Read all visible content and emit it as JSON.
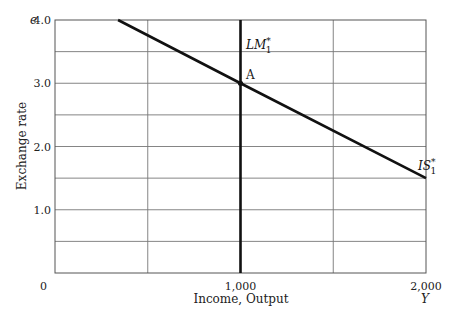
{
  "chart_data": {
    "type": "line",
    "title": "",
    "xlabel": "Income, Output",
    "xvar": "Y",
    "ylabel": "Exchange rate",
    "yvar": "e",
    "xlim": [
      0,
      2000
    ],
    "ylim": [
      0,
      4.0
    ],
    "grid": true,
    "x_ticks": [
      {
        "value": 0,
        "label": "0"
      },
      {
        "value": 1000,
        "label": "1,000"
      },
      {
        "value": 2000,
        "label": "2,000"
      }
    ],
    "x_gridlines": [
      500,
      1000,
      1500
    ],
    "y_ticks": [
      {
        "value": 1.0,
        "label": "1.0"
      },
      {
        "value": 2.0,
        "label": "2.0"
      },
      {
        "value": 3.0,
        "label": "3.0"
      },
      {
        "value": 4.0,
        "label": "4.0"
      }
    ],
    "y_gridlines": [
      0.5,
      1.0,
      1.5,
      2.0,
      2.5,
      3.0,
      3.5
    ],
    "series": [
      {
        "name": "IS*1",
        "label": "IS",
        "label_sup": "*",
        "label_sub": "1",
        "kind": "downward-sloping line",
        "points": [
          [
            340,
            4.0
          ],
          [
            1000,
            3.0
          ],
          [
            2000,
            1.5
          ]
        ]
      },
      {
        "name": "LM*1",
        "label": "LM",
        "label_sup": "*",
        "label_sub": "1",
        "kind": "vertical line",
        "points": [
          [
            1000,
            0
          ],
          [
            1000,
            4.0
          ]
        ]
      }
    ],
    "annotations": [
      {
        "text": "A",
        "x": 1000,
        "y": 3.0,
        "note": "equilibrium intersection of IS*1 and LM*1"
      }
    ]
  },
  "labels": {
    "origin": "0",
    "x_axis_title": "Income, Output",
    "x_axis_var": "Y",
    "y_axis_title": "Exchange rate",
    "y_axis_var": "e",
    "point_a": "A",
    "is_curve": "IS",
    "lm_curve": "LM",
    "star": "*",
    "sub_one": "1"
  }
}
